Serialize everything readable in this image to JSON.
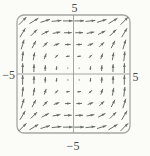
{
  "figure": {
    "background": "#fbfbf8",
    "frame_color": "#a6a6a2",
    "axis_color": "#9b9b97",
    "arrow_color": "#686d66",
    "label_color": "#4a4a46"
  },
  "chart_data": {
    "type": "quiver",
    "title": "",
    "field": {
      "u_expr": "y*y",
      "v_expr": "x*x"
    },
    "grid": {
      "x_values": [
        -4.5,
        -3.5,
        -2.5,
        -1.5,
        -0.5,
        0.5,
        1.5,
        2.5,
        3.5,
        4.5
      ],
      "y_values": [
        -4.5,
        -3.5,
        -2.5,
        -1.5,
        -0.5,
        0.5,
        1.5,
        2.5,
        3.5,
        4.5
      ]
    },
    "xlim": [
      -5,
      5
    ],
    "ylim": [
      -5,
      5
    ],
    "axis_labels": {
      "top": "5",
      "bottom": "−5",
      "left": "−5",
      "right": "5"
    },
    "frame": "rounded-rectangle",
    "grid_lines": "off",
    "legend": "none",
    "arrow_style": {
      "max_length_px": 10,
      "length_rule": "2*sqrt(|F|), capped"
    }
  }
}
